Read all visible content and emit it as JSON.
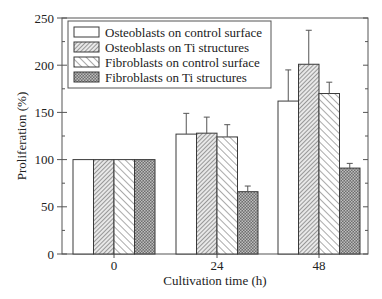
{
  "chart_data": {
    "type": "bar",
    "title": "",
    "xlabel": "Cultivation time (h)",
    "ylabel": "Proliferation (%)",
    "categories": [
      "0",
      "24",
      "48"
    ],
    "ylim": [
      0,
      250
    ],
    "yticks": [
      0,
      50,
      100,
      150,
      200,
      250
    ],
    "grid": false,
    "legend_position": "upper left, inside",
    "series": [
      {
        "name": "Osteoblasts on control surface",
        "pattern": "white",
        "values": [
          100,
          127,
          162
        ],
        "error_upper": [
          0,
          149,
          195
        ]
      },
      {
        "name": "Osteoblasts on Ti structures",
        "pattern": "fine-diagonal",
        "values": [
          100,
          128,
          201
        ],
        "error_upper": [
          0,
          145,
          237
        ]
      },
      {
        "name": "Fibroblasts on control surface",
        "pattern": "back-diagonal",
        "values": [
          100,
          124,
          170
        ],
        "error_upper": [
          0,
          137,
          182
        ]
      },
      {
        "name": "Fibroblasts on Ti structures",
        "pattern": "dark-crosshatch",
        "values": [
          100,
          66,
          91
        ],
        "error_upper": [
          0,
          72,
          96
        ]
      }
    ]
  },
  "colors": {
    "axis": "#444444",
    "bar_outline": "#3a3a3a",
    "hatch": "#555555",
    "dark_fill": "#8a8a8a"
  }
}
